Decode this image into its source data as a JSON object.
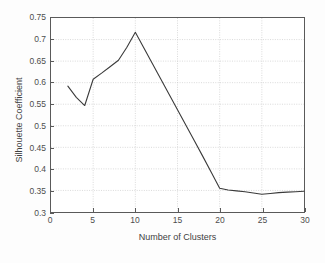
{
  "chart_data": {
    "type": "line",
    "title": "",
    "xlabel": "Number of Clusters",
    "ylabel": "Silhouette Coefficient",
    "xlim": [
      0,
      30
    ],
    "ylim": [
      0.3,
      0.75
    ],
    "xticks": [
      "0",
      "5",
      "10",
      "15",
      "20",
      "25",
      "30"
    ],
    "xtick_values": [
      0,
      5,
      10,
      15,
      20,
      25,
      30
    ],
    "yticks": [
      "0.3",
      "0.35",
      "0.4",
      "0.45",
      "0.5",
      "0.55",
      "0.6",
      "0.65",
      "0.7",
      "0.75"
    ],
    "ytick_values": [
      0.3,
      0.35,
      0.4,
      0.45,
      0.5,
      0.55,
      0.6,
      0.65,
      0.7,
      0.75
    ],
    "grid": true,
    "legend": "none",
    "series": [
      {
        "name": "Silhouette Coefficient",
        "color": "#3a3a3a",
        "x": [
          2,
          3,
          4,
          5,
          6,
          7,
          8,
          9,
          10,
          11,
          12,
          13,
          14,
          15,
          16,
          17,
          18,
          19,
          20,
          21,
          22,
          23,
          24,
          25,
          26,
          27,
          28,
          29,
          30
        ],
        "values": [
          0.592,
          0.566,
          0.547,
          0.608,
          0.622,
          0.637,
          0.652,
          0.682,
          0.717,
          0.681,
          0.645,
          0.609,
          0.573,
          0.537,
          0.501,
          0.465,
          0.429,
          0.392,
          0.355,
          0.351,
          0.349,
          0.347,
          0.344,
          0.341,
          0.343,
          0.345,
          0.346,
          0.347,
          0.348
        ]
      }
    ]
  },
  "colors": {
    "line": "#3a3a3a",
    "grid": "#c9c9c9",
    "axis": "#5a5a5a",
    "text": "#4d4d4d",
    "background": "#fdfdfd"
  }
}
